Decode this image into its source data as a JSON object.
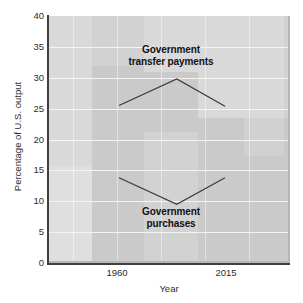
{
  "chart_data": {
    "type": "line",
    "title": "",
    "xlabel": "Year",
    "ylabel": "Percentage of U.S. output",
    "xlim": [
      1930,
      2040
    ],
    "ylim": [
      0,
      40
    ],
    "grid": true,
    "legend_position": "inline-annotations",
    "x": [
      1960,
      1990,
      2015
    ],
    "xticklabels": [
      "1960",
      "2015"
    ],
    "xticks": [
      1960,
      2015
    ],
    "yticklabels": [
      "0",
      "5",
      "10",
      "15",
      "20",
      "25",
      "30",
      "35",
      "40"
    ],
    "yticks": [
      0,
      5,
      10,
      15,
      20,
      25,
      30,
      35,
      40
    ],
    "series": [
      {
        "name": "Government transfer payments",
        "values": [
          25.5,
          29.8,
          25.4
        ],
        "annotation": "Government transfer payments"
      },
      {
        "name": "Government purchases",
        "values": [
          13.8,
          9.5,
          13.8
        ],
        "annotation": "Government purchases"
      }
    ],
    "annotations": [
      {
        "text_line1": "Government",
        "text_line2": "transfer payments"
      },
      {
        "text_line1": "Government",
        "text_line2": "purchases"
      }
    ],
    "colors": {
      "panel": "#d2d2d2",
      "gridline": "#f4f4f4",
      "axis": "#404040",
      "line": "#3a3a3a",
      "text": "#2e2e2e",
      "background": "#ffffff"
    }
  },
  "axes": {
    "y": {
      "label": "Percentage of U.S. output",
      "ticks": [
        {
          "label": "40"
        },
        {
          "label": "35"
        },
        {
          "label": "30"
        },
        {
          "label": "25"
        },
        {
          "label": "20"
        },
        {
          "label": "15"
        },
        {
          "label": "10"
        },
        {
          "label": "5"
        },
        {
          "label": "0"
        }
      ]
    },
    "x": {
      "label": "Year",
      "ticks": [
        {
          "label": "1960"
        },
        {
          "label": "2015"
        }
      ]
    }
  },
  "annotations": {
    "transfer": {
      "line1": "Government",
      "line2": "transfer payments"
    },
    "purchases": {
      "line1": "Government",
      "line2": "purchases"
    }
  }
}
